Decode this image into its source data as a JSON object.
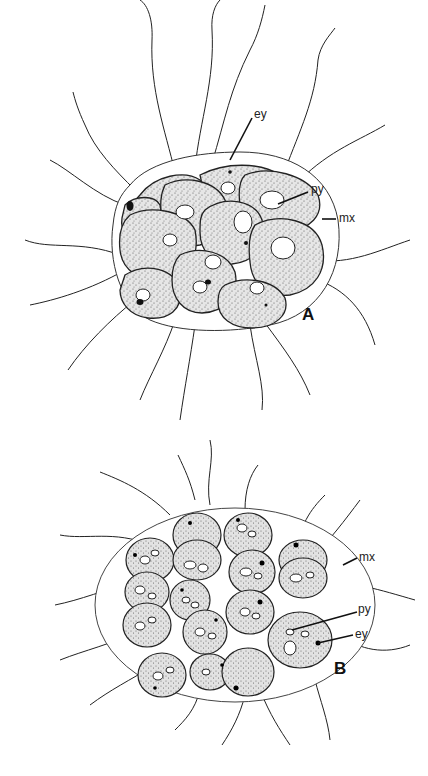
{
  "figure": {
    "panels": [
      {
        "id": "A",
        "label": "A",
        "description": "Compact 16-celled colony enclosed in a gelatinous matrix with flagella projecting outward",
        "annotations": [
          {
            "abbr": "ey",
            "meaning": "eyespot"
          },
          {
            "abbr": "py",
            "meaning": "pyrenoid"
          },
          {
            "abbr": "mx",
            "meaning": "matrix"
          }
        ]
      },
      {
        "id": "B",
        "label": "B",
        "description": "Loose 16-celled colony of spherical cells in an oval matrix with flagella",
        "annotations": [
          {
            "abbr": "mx",
            "meaning": "matrix"
          },
          {
            "abbr": "py",
            "meaning": "pyrenoid"
          },
          {
            "abbr": "ey",
            "meaning": "eyespot"
          }
        ]
      }
    ],
    "labels": {
      "a_ey": "ey",
      "a_py": "py",
      "a_mx": "mx",
      "a_panel": "A",
      "b_mx": "mx",
      "b_py": "py",
      "b_ey": "ey",
      "b_panel": "B"
    }
  }
}
